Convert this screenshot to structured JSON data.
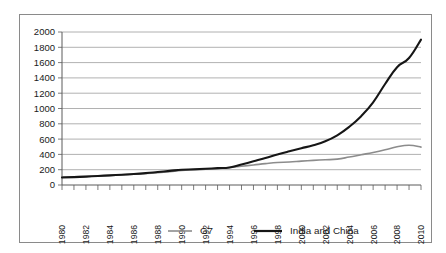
{
  "chart_data": {
    "type": "line",
    "title": "",
    "subtitle": "",
    "xlabel": "",
    "ylabel": "",
    "xlim": [
      1980,
      2010
    ],
    "ylim": [
      0,
      2000
    ],
    "grid": true,
    "legend_position": "bottom",
    "y_ticks": [
      0,
      200,
      400,
      600,
      800,
      1000,
      1200,
      1400,
      1600,
      1800,
      2000
    ],
    "x_ticks": [
      1980,
      1982,
      1984,
      1986,
      1988,
      1990,
      1992,
      1994,
      1996,
      1998,
      2000,
      2002,
      2004,
      2006,
      2008,
      2010
    ],
    "x": [
      1980,
      1981,
      1982,
      1983,
      1984,
      1985,
      1986,
      1987,
      1988,
      1989,
      1990,
      1991,
      1992,
      1993,
      1994,
      1995,
      1996,
      1997,
      1998,
      1999,
      2000,
      2001,
      2002,
      2003,
      2004,
      2005,
      2006,
      2007,
      2008,
      2009,
      2010
    ],
    "series": [
      {
        "name": "G7",
        "color": "#8c8c8c",
        "values": [
          105,
          108,
          112,
          118,
          125,
          132,
          140,
          150,
          162,
          175,
          190,
          198,
          205,
          215,
          228,
          245,
          262,
          280,
          295,
          300,
          312,
          322,
          330,
          338,
          365,
          395,
          425,
          460,
          500,
          520,
          495
        ]
      },
      {
        "name": "India and China",
        "color": "#161616",
        "values": [
          98,
          103,
          110,
          118,
          126,
          134,
          143,
          155,
          170,
          185,
          200,
          205,
          212,
          220,
          228,
          268,
          310,
          352,
          398,
          440,
          480,
          520,
          572,
          650,
          760,
          900,
          1080,
          1320,
          1540,
          1660,
          1900
        ]
      }
    ]
  },
  "legend": {
    "items": [
      {
        "label": "G7",
        "color": "#8c8c8c"
      },
      {
        "label": "India and China",
        "color": "#161616"
      }
    ]
  }
}
